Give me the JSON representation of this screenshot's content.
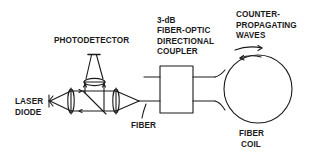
{
  "diagram": {
    "type": "fiber-optic-gyroscope-schematic",
    "labels": {
      "photodetector": "PHOTODETECTOR",
      "coupler_line1": "3-dB",
      "coupler_line2": "FIBER-OPTIC",
      "coupler_line3": "DIRECTIONAL",
      "coupler_line4": "COUPLER",
      "waves_line1": "COUNTER-",
      "waves_line2": "PROPAGATING",
      "waves_line3": "WAVES",
      "laser_line1": "LASER",
      "laser_line2": "DIODE",
      "fiber": "FIBER",
      "coil_line1": "FIBER",
      "coil_line2": "COIL"
    },
    "components": [
      "laser-diode",
      "collimating-lens",
      "beam-splitter",
      "photodetector",
      "focusing-lens",
      "fiber",
      "directional-coupler",
      "fiber-coil"
    ],
    "colors": {
      "stroke": "#1a1a1a",
      "background": "#ffffff"
    }
  }
}
